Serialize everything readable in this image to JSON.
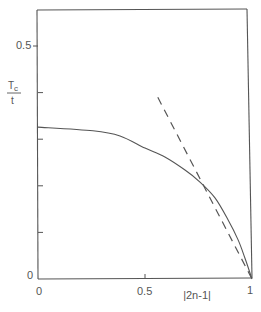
{
  "chart_data": {
    "type": "line",
    "title": "",
    "xlabel": "|2n-1|",
    "ylabel": "T_c / t",
    "ylabel_numerator": "T",
    "ylabel_subscript": "c",
    "ylabel_denominator": "t",
    "xlim": [
      0,
      1
    ],
    "ylim": [
      0,
      0.577
    ],
    "x_ticks": [
      0,
      0.5,
      1
    ],
    "x_tick_labels": [
      "0",
      "0.5",
      "1"
    ],
    "y_ticks": [
      0,
      0.1,
      0.2,
      0.3,
      0.4,
      0.5
    ],
    "y_tick_labels": [
      "0",
      "",
      "",
      "",
      "",
      "0.5"
    ],
    "grid": false,
    "legend": null,
    "series": [
      {
        "name": "exact (solid)",
        "style": "solid",
        "x": [
          0,
          0.257,
          0.383,
          0.5,
          0.593,
          0.687,
          0.757,
          0.827,
          0.888,
          0.935,
          0.967,
          1.0
        ],
        "y": [
          0.326,
          0.318,
          0.307,
          0.281,
          0.262,
          0.234,
          0.208,
          0.174,
          0.127,
          0.084,
          0.045,
          0.0
        ]
      },
      {
        "name": "asymptote (dashed)",
        "style": "dashed",
        "x": [
          0.56,
          1.0
        ],
        "y": [
          0.39,
          0.0
        ]
      }
    ]
  },
  "colors": {
    "axis": "#555555",
    "line": "#555555",
    "background": "#ffffff"
  }
}
